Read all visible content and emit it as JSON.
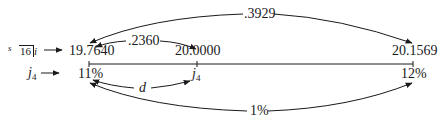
{
  "diagram": {
    "row_labels": {
      "accumulation": {
        "prefix": "s",
        "subscript_angle": "16",
        "suffix": "i"
      },
      "rate": {
        "symbol": "j",
        "subscript": "4"
      }
    },
    "timeline": {
      "points": [
        {
          "value": "19.7640",
          "rate": "11%"
        },
        {
          "value": "20.0000",
          "rate_symbol": "j",
          "rate_subscript": "4"
        },
        {
          "value": "20.1569",
          "rate": "12%"
        }
      ]
    },
    "arcs": {
      "top_short": ".2360",
      "top_long": ".3929",
      "bottom_short": "d",
      "bottom_long": "1%"
    },
    "colors": {
      "ink": "#1a1a1a",
      "background": "#ffffff"
    }
  }
}
